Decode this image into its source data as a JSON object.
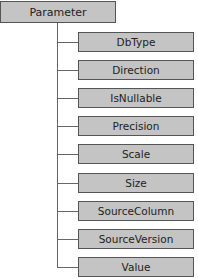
{
  "root": {
    "label": "Parameter"
  },
  "children": [
    {
      "label": "DbType"
    },
    {
      "label": "Direction"
    },
    {
      "label": "IsNullable"
    },
    {
      "label": "Precision"
    },
    {
      "label": "Scale"
    },
    {
      "label": "Size"
    },
    {
      "label": "SourceColumn"
    },
    {
      "label": "SourceVersion"
    },
    {
      "label": "Value"
    }
  ],
  "colors": {
    "box_fill": "#c4c4c4",
    "box_border": "#555555",
    "connector": "#666666"
  }
}
